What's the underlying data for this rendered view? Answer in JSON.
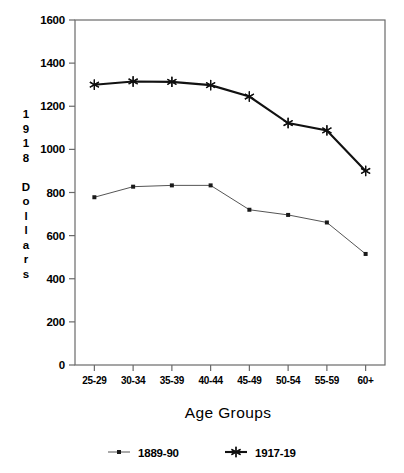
{
  "chart_data": {
    "type": "line",
    "title": "",
    "xlabel": "Age Groups",
    "ylabel": "1918 Dollars",
    "categories": [
      "25-29",
      "30-34",
      "35-39",
      "40-44",
      "45-49",
      "50-54",
      "55-59",
      "60+"
    ],
    "series": [
      {
        "name": "1889-90",
        "marker": "dot-marker",
        "color": "#555555",
        "values": [
          778,
          827,
          833,
          833,
          720,
          696,
          661,
          515
        ]
      },
      {
        "name": "1917-19",
        "marker": "star-marker",
        "color": "#111111",
        "values": [
          1300,
          1315,
          1313,
          1298,
          1245,
          1122,
          1088,
          900
        ]
      }
    ],
    "ylim": [
      0,
      1600
    ],
    "yticks": [
      0,
      200,
      400,
      600,
      800,
      1000,
      1200,
      1400,
      1600
    ],
    "ytick_labels": [
      "0",
      "200",
      "400",
      "600",
      "800",
      "1000",
      "1200",
      "1400",
      "1600"
    ],
    "grid": false,
    "legend_position": "bottom"
  },
  "yaxis": {
    "label_chars": [
      "1",
      "9",
      "1",
      "8",
      "",
      "D",
      "o",
      "l",
      "l",
      "a",
      "r",
      "s"
    ]
  },
  "legend": {
    "entries": [
      {
        "label": "1889-90",
        "marker": "dot-marker"
      },
      {
        "label": "1917-19",
        "marker": "star-marker"
      }
    ]
  }
}
